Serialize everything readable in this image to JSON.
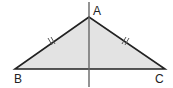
{
  "diagram": {
    "type": "isosceles-triangle-with-axis-of-symmetry",
    "vertices": {
      "A": {
        "label": "A",
        "x": 89,
        "y": 17
      },
      "B": {
        "label": "B",
        "x": 15,
        "y": 69
      },
      "C": {
        "label": "C",
        "x": 165,
        "y": 69
      }
    },
    "equal_sides": [
      "AB",
      "AC"
    ],
    "tick_marks": "double",
    "axis": {
      "x": 89,
      "y1": 2,
      "y2": 87
    },
    "colors": {
      "fill": "#e3e3e3",
      "stroke": "#222222",
      "axis": "#666666",
      "background": "#ffffff"
    }
  }
}
